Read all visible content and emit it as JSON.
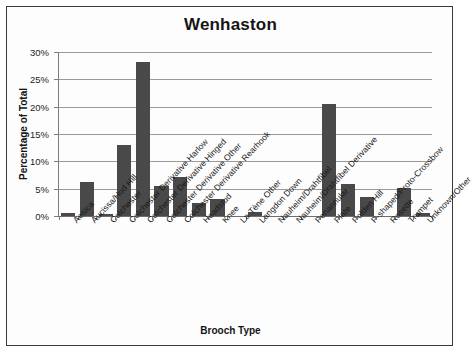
{
  "chart_data": {
    "type": "bar",
    "title": "Wenhaston",
    "xlabel": "Brooch Type",
    "ylabel": "Percentage of Total",
    "ylim": [
      0,
      30
    ],
    "ytick_labels": [
      "0%",
      "5%",
      "10%",
      "15%",
      "20%",
      "25%",
      "30%"
    ],
    "ytick_values": [
      0,
      5,
      10,
      15,
      20,
      25,
      30
    ],
    "grid": true,
    "legend": "none",
    "bar_color": "#494949",
    "categories": [
      "Aesica",
      "Aucissa/Hod Hill",
      "Colchester",
      "Colchester Derivative Harlow",
      "Colchester Derivative Hinged",
      "Colchester Derivative Other",
      "Colchester Derivative Rearhook",
      "Headstud",
      "Knee",
      "La Tène Other",
      "Langdon Down",
      "Nauheim/Drahtfibel",
      "Nauheim/Drahtfibel Derivative",
      "Penannular",
      "Plate",
      "Polden Hill",
      "P-shaped/Proto-Crossbow",
      "Rosette",
      "Trumpet",
      "Unknown/Other"
    ],
    "values": [
      0.6,
      6.3,
      0.4,
      12.9,
      28.2,
      5.5,
      7.2,
      2.3,
      3.1,
      0,
      0.8,
      0,
      0,
      0,
      20.4,
      5.8,
      3.5,
      0,
      5.2,
      0.6
    ]
  }
}
